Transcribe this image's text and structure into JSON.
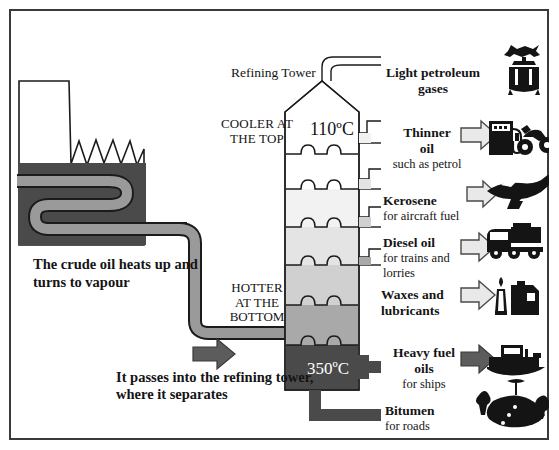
{
  "diagram": {
    "title_tower": "Refining Tower",
    "cooler_label": "COOLER AT\nTHE TOP",
    "cooler_line1": "COOLER AT",
    "cooler_line2": "THE TOP",
    "hotter_line1": "HOTTER",
    "hotter_line2": "AT THE",
    "hotter_line3": "BOTTOM",
    "temp_top": "110ºC",
    "temp_bottom": "350ºC",
    "crude_text": "The crude oil heats up and turns to vapour",
    "passes_text": "It passes into the refining tower, where it separates",
    "colors": {
      "border": "#3a3a3a",
      "furnace_dark": "#4a4a4a",
      "pipe_gray": "#9a9a9a",
      "ink": "#141414",
      "band_1": "#ffffff",
      "band_2": "#ffffff",
      "band_3": "#efefef",
      "band_4": "#e2e2e2",
      "band_5": "#cfcfcf",
      "band_6": "#a8a8a8",
      "band_7": "#4a4a4a"
    },
    "outputs": [
      {
        "name": "light-petroleum-gases",
        "main": "Light petroleum",
        "main2": "gases",
        "sub": "",
        "icon": "gas-stove-icon",
        "arrow": false
      },
      {
        "name": "thinner-oil",
        "main": "Thinner",
        "main2": "oil",
        "sub": "such as petrol",
        "icon": "petrol-pump-and-motorcycle-icon",
        "arrow": true,
        "arrow_style": "outline"
      },
      {
        "name": "kerosene",
        "main": "Kerosene",
        "main2": "",
        "sub": "for aircraft fuel",
        "icon": "airplane-icon",
        "arrow": true,
        "arrow_style": "outline"
      },
      {
        "name": "diesel-oil",
        "main": "Diesel oil",
        "main2": "",
        "sub": "for trains and lorries",
        "icon": "truck-icon",
        "arrow": true,
        "arrow_style": "outline"
      },
      {
        "name": "waxes-and-lubricants",
        "main": "Waxes and",
        "main2": "lubricants",
        "sub": "",
        "icon": "candle-and-oil-can-icon",
        "arrow": true,
        "arrow_style": "outline"
      },
      {
        "name": "heavy-fuel-oils",
        "main": "Heavy fuel",
        "main2": "oils",
        "sub": "for ships",
        "icon": "ship-icon",
        "arrow": true,
        "arrow_style": "solid"
      },
      {
        "name": "bitumen",
        "main": "Bitumen",
        "main2": "",
        "sub": "for roads",
        "icon": "road-icon",
        "arrow": false
      }
    ]
  }
}
